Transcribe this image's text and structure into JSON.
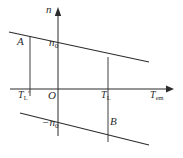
{
  "figure": {
    "background_color": "#ffffff",
    "line_color": "#2b2b2b",
    "width": 183,
    "height": 158
  },
  "axes": {
    "vertical": {
      "name": "n-axis",
      "label": "n",
      "x": 58,
      "y_top": 10,
      "y_bottom": 136,
      "arrow": "up"
    },
    "horizontal": {
      "name": "T-em-axis",
      "label": "T",
      "label_subscript": "em",
      "y": 89,
      "x_left": 10,
      "x_right": 172,
      "arrow": "right"
    },
    "origin_label": "O",
    "origin_x": 58,
    "origin_y": 89
  },
  "curves": [
    {
      "name": "upper-characteristic-line",
      "x1": 9,
      "y1": 32,
      "x2": 149,
      "y2": 62,
      "description": "forward motoring characteristic through n0"
    },
    {
      "name": "lower-characteristic-line",
      "x1": 20,
      "y1": 113,
      "x2": 149,
      "y2": 145,
      "description": "reverse characteristic through -n0"
    }
  ],
  "connectors": [
    {
      "name": "left-vertical-connector",
      "x": 30,
      "y1": 36,
      "y2": 96,
      "tick_label": "T",
      "tick_subscript": "L",
      "tick_prime": true
    },
    {
      "name": "right-vertical-connector",
      "x": 108,
      "y1": 57,
      "y2": 142,
      "tick_label": "T",
      "tick_subscript": "L",
      "tick_prime": false
    }
  ],
  "labels": {
    "n_axis": "n",
    "point_a": "A",
    "point_b": "B",
    "n0": "n",
    "n0_sub": "0",
    "neg_n0": "−n",
    "neg_n0_sub": "0",
    "origin": "O",
    "t_l_prime": "T",
    "t_l_prime_sub": "L",
    "t_l_prime_mark": "′",
    "t_l": "T",
    "t_l_sub": "L",
    "t_em": "T",
    "t_em_sub": "em"
  }
}
